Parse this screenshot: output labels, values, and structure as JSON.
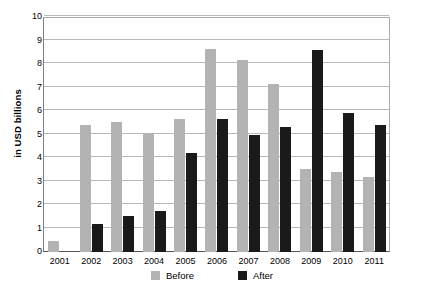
{
  "chart_data": {
    "type": "bar",
    "title": "",
    "subtitle": "",
    "xlabel": "",
    "ylabel": "in USD billions",
    "ylim": [
      0,
      10
    ],
    "y_ticks": [
      0,
      1,
      2,
      3,
      4,
      5,
      6,
      7,
      8,
      9,
      10
    ],
    "grid": true,
    "legend_position": "bottom-center",
    "categories": [
      "2001",
      "2002",
      "2003",
      "2004",
      "2005",
      "2006",
      "2007",
      "2008",
      "2009",
      "2010",
      "2011"
    ],
    "series": [
      {
        "name": "Before",
        "color": "#b3b3b3",
        "values": [
          0.45,
          5.4,
          5.55,
          5.05,
          5.65,
          8.65,
          8.15,
          7.15,
          3.55,
          3.4,
          3.2
        ]
      },
      {
        "name": "After",
        "color": "#1a1a1a",
        "values": [
          0,
          1.2,
          1.55,
          1.75,
          4.2,
          5.65,
          5.0,
          5.3,
          8.6,
          5.9,
          5.4
        ]
      }
    ]
  },
  "legend": {
    "items": [
      {
        "label": "Before",
        "swatch": "before-swatch"
      },
      {
        "label": "After",
        "swatch": "after-swatch"
      }
    ]
  }
}
